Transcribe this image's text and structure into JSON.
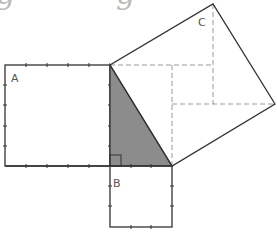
{
  "title_fragment": {
    "text": "g             g",
    "color": "#bbbbbb"
  },
  "diagram": {
    "type": "pythagorean-theorem-squares",
    "stroke": "#333333",
    "fill_triangle": "#8c8c8c",
    "dash_color": "#999999",
    "labels": {
      "a": "A",
      "b": "B",
      "c": "C"
    },
    "triangle": [
      [
        110,
        65
      ],
      [
        110,
        166
      ],
      [
        172,
        166
      ]
    ],
    "square_a": {
      "x": 5,
      "y": 65,
      "w": 105,
      "h": 101,
      "ticks_x": [
        26,
        47,
        68,
        89
      ],
      "ticks_y": [
        85,
        105,
        126,
        146
      ]
    },
    "square_b": {
      "x": 110,
      "y": 166,
      "w": 62,
      "h": 61,
      "ticks_x": [
        131,
        151
      ],
      "ticks_y": [
        186,
        206
      ]
    },
    "square_c": [
      [
        110,
        65
      ],
      [
        172,
        166
      ],
      [
        275,
        104
      ],
      [
        213,
        4
      ]
    ],
    "right_angle_marker": {
      "x": 110,
      "y": 155,
      "size": 11
    },
    "dashed_lines": [
      [
        [
          110,
          65
        ],
        [
          213,
          65
        ]
      ],
      [
        [
          213,
          4
        ],
        [
          213,
          104
        ]
      ],
      [
        [
          172,
          65
        ],
        [
          172,
          166
        ]
      ],
      [
        [
          172,
          104
        ],
        [
          275,
          104
        ]
      ]
    ]
  }
}
